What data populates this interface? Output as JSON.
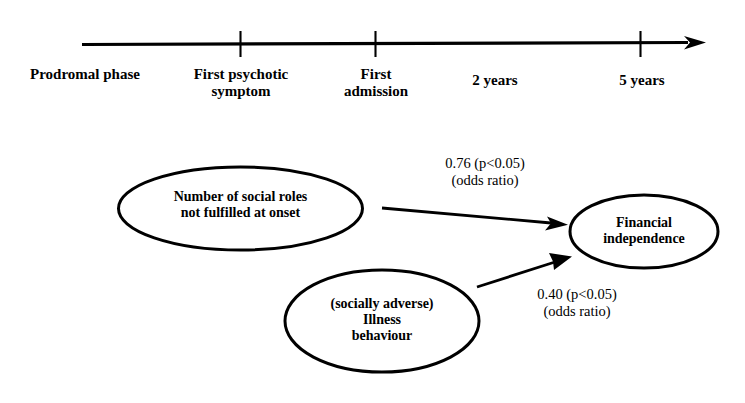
{
  "figure": {
    "type": "timeline-and-path-diagram",
    "background_color": "#ffffff",
    "stroke_color": "#000000"
  },
  "timeline": {
    "axis_name": "illness-course-timeline",
    "arrow_direction": "right",
    "ticks": [
      {
        "label_line1": "Prodromal phase",
        "label_line2": "",
        "has_tick_mark": false
      },
      {
        "label_line1": "First psychotic",
        "label_line2": "symptom",
        "has_tick_mark": true
      },
      {
        "label_line1": "First",
        "label_line2": "admission",
        "has_tick_mark": true
      },
      {
        "label_line1": "2 years",
        "label_line2": "",
        "has_tick_mark": false
      },
      {
        "label_line1": "5 years",
        "label_line2": "",
        "has_tick_mark": true
      }
    ]
  },
  "path_diagram": {
    "nodes": [
      {
        "id": "social-roles",
        "lines": [
          "Number of social roles",
          "not fulfilled at onset"
        ]
      },
      {
        "id": "illness-behaviour",
        "lines": [
          "(socially adverse)",
          "Illness",
          "behaviour"
        ]
      },
      {
        "id": "financial-independence",
        "lines": [
          "Financial",
          "independence"
        ]
      }
    ],
    "edges": [
      {
        "id": "social-roles-to-financial-independence",
        "from": "social-roles",
        "to": "financial-independence",
        "label_line1": "0.76 (p<0.05)",
        "label_line2": "(odds ratio)",
        "coefficient": 0.76,
        "p_value": "p<0.05",
        "statistic": "odds ratio"
      },
      {
        "id": "illness-behaviour-to-financial-independence",
        "from": "illness-behaviour",
        "to": "financial-independence",
        "label_line1": "0.40 (p<0.05)",
        "label_line2": "(odds ratio)",
        "coefficient": 0.4,
        "p_value": "p<0.05",
        "statistic": "odds ratio"
      }
    ]
  }
}
